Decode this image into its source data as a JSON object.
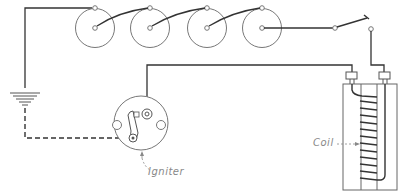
{
  "diagram": {
    "type": "wiring-schematic",
    "labels": {
      "igniter": "Igniter",
      "coil": "Coil"
    },
    "components": [
      {
        "name": "dry-cell",
        "count": 4
      },
      {
        "name": "switch"
      },
      {
        "name": "ground"
      },
      {
        "name": "igniter"
      },
      {
        "name": "coil"
      }
    ],
    "colors": {
      "wire": "#333333",
      "outline": "#666666",
      "label": "#888888"
    }
  }
}
